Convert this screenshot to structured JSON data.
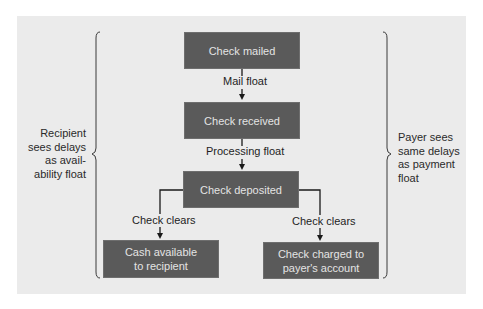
{
  "diagram": {
    "type": "flowchart",
    "nodes": {
      "check_mailed": "Check mailed",
      "check_received": "Check received",
      "check_deposited": "Check deposited",
      "cash_available": [
        "Cash available",
        "to recipient"
      ],
      "check_charged": [
        "Check charged to",
        "payer's account"
      ]
    },
    "edges": {
      "mail_float": "Mail float",
      "processing_float": "Processing float",
      "clears_left": "Check clears",
      "clears_right": "Check clears"
    },
    "left_brace_note": [
      "Recipient",
      "sees delays",
      "as avail-",
      "ability float"
    ],
    "right_brace_note": [
      "Payer sees",
      "same delays",
      "as payment",
      "float"
    ],
    "colors": {
      "panel": "#ebebeb",
      "box_fill": "#5a5a5a",
      "box_text": "#e4e4e4",
      "line": "#1a1a1a"
    }
  }
}
